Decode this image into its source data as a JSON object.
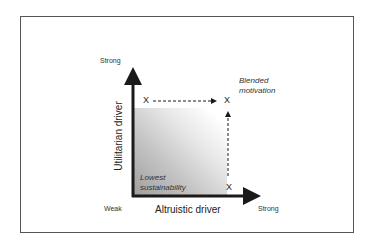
{
  "diagram": {
    "y_axis": {
      "title": "Utilitarian driver",
      "high_label": "Strong"
    },
    "x_axis": {
      "title": "Altruistic driver",
      "low_label": "Weak",
      "high_label": "Strong"
    },
    "regions": {
      "bottom_left": "Lowest sustainability",
      "bottom_left_line1": "Lowest",
      "bottom_left_line2": "sustainability",
      "top_right_line1": "Blended",
      "top_right_line2": "motivation"
    },
    "markers": [
      {
        "label": "X",
        "position": "strong utilitarian, weak altruistic"
      },
      {
        "label": "X",
        "position": "strong utilitarian, strong altruistic"
      },
      {
        "label": "X",
        "position": "weak utilitarian, strong altruistic"
      }
    ],
    "arrows": [
      {
        "from": "top-left X",
        "to": "top-right X",
        "style": "dashed"
      },
      {
        "from": "bottom-right X",
        "to": "top-right X",
        "style": "dashed"
      }
    ],
    "colors": {
      "axis": "#1a1a1a",
      "shade_dark": "#9e9e9e",
      "shade_light": "#ffffff",
      "frame": "#555555"
    }
  }
}
